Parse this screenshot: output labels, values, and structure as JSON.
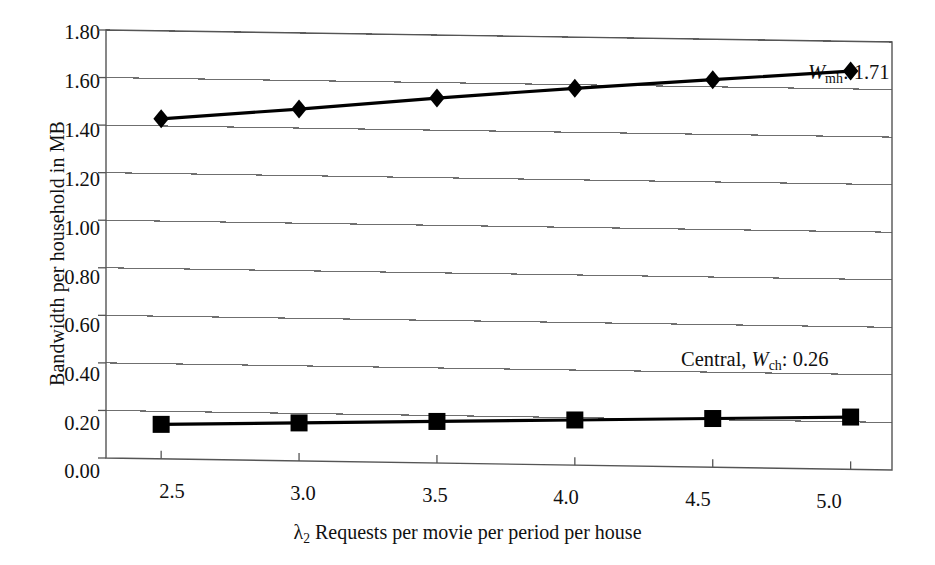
{
  "chart_data": {
    "type": "line",
    "title": "",
    "subtitle": "",
    "xlabel": "λ2 Requests per movie per period per house",
    "xlabel_parts": {
      "symbol": "λ",
      "symbol_sub": "2",
      "rest": "Requests per movie per period per house"
    },
    "ylabel": "Bandwidth per household in MB",
    "x": [
      2.5,
      3.0,
      3.5,
      4.0,
      4.5,
      5.0
    ],
    "xticklabels": [
      "2.5",
      "3.0",
      "3.5",
      "4.0",
      "4.5",
      "5.0"
    ],
    "yticklabels": [
      "0.00",
      "0.20",
      "0.40",
      "0.60",
      "0.80",
      "1.00",
      "1.20",
      "1.40",
      "1.60",
      "1.80"
    ],
    "yticks": [
      0.0,
      0.2,
      0.4,
      0.6,
      0.8,
      1.0,
      1.2,
      1.4,
      1.6,
      1.8
    ],
    "xlim": [
      2.3,
      5.15
    ],
    "ylim": [
      0.0,
      1.8
    ],
    "grid": "horizontal",
    "legend": "none",
    "series": [
      {
        "name": "W_mh",
        "marker": "diamond",
        "color": "#000000",
        "values": [
          1.43,
          1.48,
          1.535,
          1.585,
          1.63,
          1.675
        ]
      },
      {
        "name": "Central W_ch",
        "marker": "square",
        "color": "#000000",
        "values": [
          0.145,
          0.16,
          0.175,
          0.19,
          0.205,
          0.22
        ]
      }
    ],
    "annotations": [
      {
        "id": "w-mh",
        "prefix": "",
        "symbol": "W",
        "symbol_sub": "mh",
        "value": "1.71",
        "text": "Wmh: 1.71",
        "x": 4.72,
        "y": 1.635
      },
      {
        "id": "w-ch",
        "prefix": "Central, ",
        "symbol": "W",
        "symbol_sub": "ch",
        "value": "0.26",
        "text": "Central, Wch: 0.26",
        "x": 4.32,
        "y": 0.455
      }
    ]
  },
  "colors": {
    "ink": "#111111",
    "grid": "#6f6f6f",
    "axis": "#555555",
    "series": "#000000",
    "background": "#ffffff"
  }
}
